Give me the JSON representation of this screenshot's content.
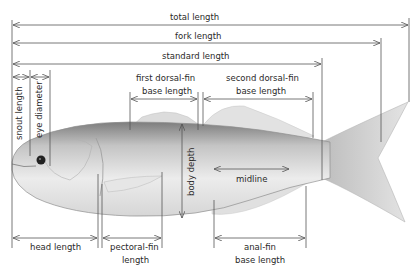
{
  "diagram": {
    "labels": {
      "total_length": "total length",
      "fork_length": "fork length",
      "standard_length": "standard length",
      "snout_length": "snout length",
      "eye_diameter": "eye diameter",
      "first_dorsal_line1": "first dorsal-fin",
      "first_dorsal_line2": "base length",
      "second_dorsal_line1": "second dorsal-fin",
      "second_dorsal_line2": "base length",
      "body_depth": "body depth",
      "midline": "midline",
      "head_length": "head length",
      "pectoral_line1": "pectoral-fin",
      "pectoral_line2": "length",
      "anal_line1": "anal-fin",
      "anal_line2": "base length"
    },
    "colors": {
      "line": "#555555",
      "text": "#2a2a2a",
      "fish_dark": "#8a8a8a",
      "fish_light": "#e6e6e6"
    }
  }
}
